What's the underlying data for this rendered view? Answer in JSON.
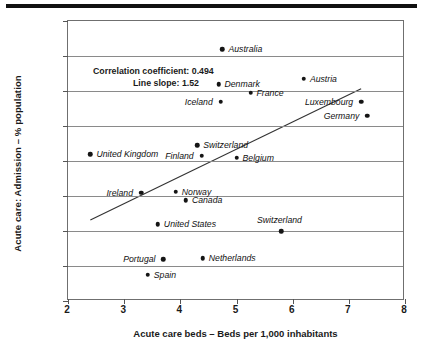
{
  "chart_data": {
    "type": "scatter",
    "title": "",
    "xlabel": "Acute care beds – Beds per 1,000 inhabitants",
    "ylabel": "Acute care: Admission – % population",
    "xlim": [
      2,
      8
    ],
    "ylim": [
      8,
      24
    ],
    "xticks": [
      2,
      3,
      4,
      5,
      6,
      7,
      8
    ],
    "yticks": [
      8,
      10,
      12,
      14,
      16,
      18,
      20,
      22,
      24
    ],
    "grid": true,
    "legend": "none",
    "points": [
      {
        "label": "Australia",
        "x": 4.75,
        "y": 22.4,
        "label_side": "right"
      },
      {
        "label": "Denmark",
        "x": 4.68,
        "y": 20.4,
        "label_side": "right"
      },
      {
        "label": "Austria",
        "x": 6.2,
        "y": 20.7,
        "label_side": "right"
      },
      {
        "label": "France",
        "x": 5.25,
        "y": 19.9,
        "label_side": "right"
      },
      {
        "label": "Iceland",
        "x": 4.72,
        "y": 19.4,
        "label_side": "left"
      },
      {
        "label": "Luxembourg",
        "x": 7.22,
        "y": 19.4,
        "label_side": "left"
      },
      {
        "label": "Germany",
        "x": 7.33,
        "y": 18.6,
        "label_side": "left"
      },
      {
        "label": "Switzerland",
        "x": 4.3,
        "y": 16.9,
        "label_side": "right"
      },
      {
        "label": "United Kingdom",
        "x": 2.4,
        "y": 16.4,
        "label_side": "right"
      },
      {
        "label": "Finland",
        "x": 4.38,
        "y": 16.3,
        "label_side": "left"
      },
      {
        "label": "Belgium",
        "x": 5.0,
        "y": 16.2,
        "label_side": "right"
      },
      {
        "label": "Ireland",
        "x": 3.3,
        "y": 14.2,
        "label_side": "left"
      },
      {
        "label": "Norway",
        "x": 3.92,
        "y": 14.25,
        "label_side": "right"
      },
      {
        "label": "Canada",
        "x": 4.1,
        "y": 13.75,
        "label_side": "right"
      },
      {
        "label": "United States",
        "x": 3.6,
        "y": 12.4,
        "label_side": "right"
      },
      {
        "label": "Switzerland",
        "x": 5.8,
        "y": 12.0,
        "label_side": "above"
      },
      {
        "label": "Portugal",
        "x": 3.7,
        "y": 10.4,
        "label_side": "left"
      },
      {
        "label": "Netherlands",
        "x": 4.4,
        "y": 10.45,
        "label_side": "right"
      },
      {
        "label": "Spain",
        "x": 3.42,
        "y": 9.5,
        "label_side": "right"
      }
    ],
    "trendline": {
      "x1": 2.4,
      "y1": 12.55,
      "x2": 7.25,
      "y2": 20.1,
      "slope": 1.52
    },
    "annotations": {
      "correlation_label": "Correlation coefficient:",
      "correlation_value": "0.494",
      "slope_label": "Line slope:",
      "slope_value": "1.52"
    }
  }
}
